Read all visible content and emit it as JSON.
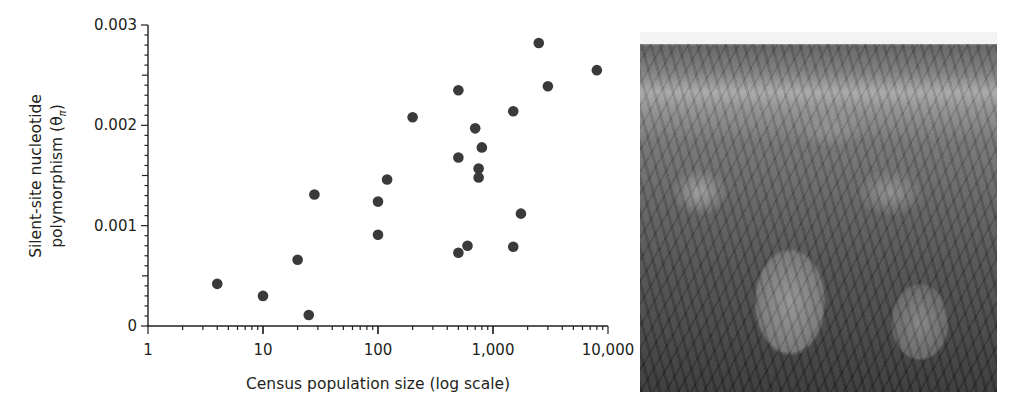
{
  "chart_data": {
    "type": "scatter",
    "title": "",
    "xlabel": "Census population size (log scale)",
    "ylabel": "Silent-site nucleotide polymorphism (θπ)",
    "ylabel_lines": [
      "Silent-site nucleotide",
      "polymorphism (θ",
      "π",
      ")"
    ],
    "xscale": "log",
    "xlim": [
      1,
      10000
    ],
    "ylim": [
      0,
      0.003
    ],
    "xticks": [
      1,
      10,
      100,
      1000,
      10000
    ],
    "xtick_labels": [
      "1",
      "10",
      "100",
      "1,000",
      "10,000"
    ],
    "yticks": [
      0,
      0.001,
      0.002,
      0.003
    ],
    "ytick_labels": [
      "0",
      "0.001",
      "0.002",
      "0.003"
    ],
    "y_minor_step": 0.0001,
    "grid": false,
    "legend": null,
    "marker_color": "#3a3a3a",
    "axis_color": "#231f20",
    "points": [
      {
        "x": 4,
        "y": 0.00042
      },
      {
        "x": 10,
        "y": 0.0003
      },
      {
        "x": 20,
        "y": 0.00066
      },
      {
        "x": 25,
        "y": 0.00011
      },
      {
        "x": 28,
        "y": 0.00131
      },
      {
        "x": 100,
        "y": 0.00124
      },
      {
        "x": 100,
        "y": 0.00091
      },
      {
        "x": 120,
        "y": 0.00146
      },
      {
        "x": 200,
        "y": 0.00208
      },
      {
        "x": 500,
        "y": 0.00235
      },
      {
        "x": 500,
        "y": 0.00168
      },
      {
        "x": 500,
        "y": 0.00073
      },
      {
        "x": 600,
        "y": 0.0008
      },
      {
        "x": 700,
        "y": 0.00197
      },
      {
        "x": 800,
        "y": 0.00178
      },
      {
        "x": 750,
        "y": 0.00157
      },
      {
        "x": 750,
        "y": 0.00148
      },
      {
        "x": 1500,
        "y": 0.00214
      },
      {
        "x": 1500,
        "y": 0.00079
      },
      {
        "x": 1750,
        "y": 0.00112
      },
      {
        "x": 2500,
        "y": 0.00282
      },
      {
        "x": 3000,
        "y": 0.00239
      },
      {
        "x": 8000,
        "y": 0.00255
      }
    ]
  },
  "photo": {
    "description": "Grayscale field photograph of leafy plants with rocky hill and shrubs in background"
  }
}
